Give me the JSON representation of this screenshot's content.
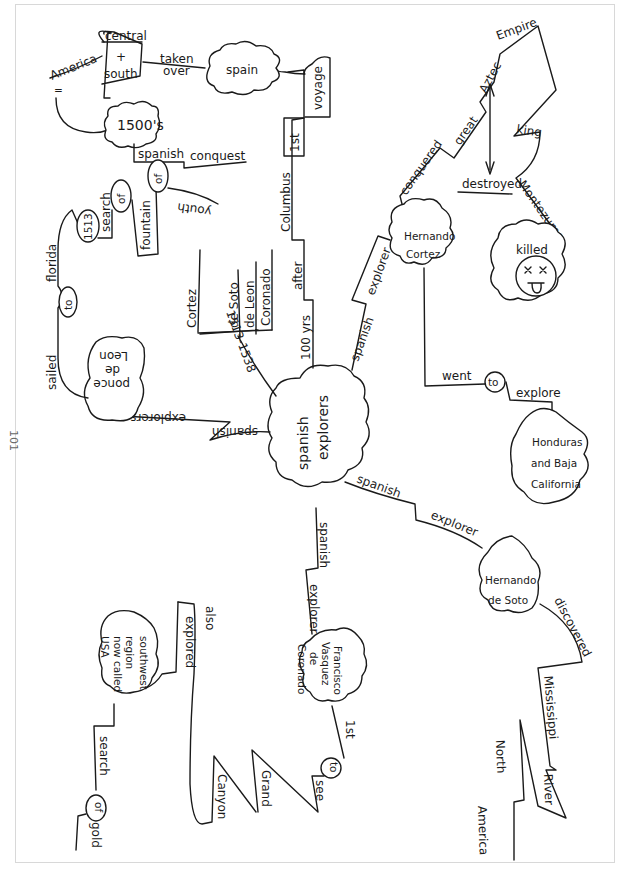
{
  "page_number": "101",
  "central_topic": {
    "line1": "spanish",
    "line2": "explorers"
  },
  "branches": {
    "history": {
      "label1": "100 yrs",
      "label2": "after",
      "label3": "Columbus",
      "label4": "1st",
      "label5": "voyage",
      "node_spain": "spain",
      "link_taken": "taken",
      "link_over": "over",
      "node_america_central": "central",
      "node_america_plus": "+",
      "node_america_south": "south",
      "link_america": "America",
      "link_equals": "=",
      "node_1500s": "1500's",
      "link_spanish": "spanish",
      "link_conquest": "conquest"
    },
    "timeline": {
      "range": "1513-1538",
      "names": [
        "Cortez",
        "de Soto",
        "de Leon",
        "Coronado"
      ]
    },
    "ponce": {
      "link1": "spanish",
      "link2": "explorers",
      "node_line1": "ponce",
      "node_line2": "de",
      "node_line3": "Leon",
      "sailed": "sailed",
      "to": "to",
      "florida": "florida",
      "year": "1513",
      "search": "search",
      "of1": "of",
      "fountain": "fountain",
      "of2": "of",
      "youth": "youth"
    },
    "cortez": {
      "link1": "spanish",
      "link2": "explorer",
      "node_line1": "Hernando",
      "node_line2": "Cortez",
      "conquered": "conquered",
      "great": "great",
      "aztec": "Aztec",
      "empire": "Empire",
      "destroyed": "destroyed",
      "king": "king",
      "montezuma": "Montezuma",
      "killed": "killed",
      "went": "went",
      "to": "to",
      "explore": "explore",
      "dest_line1": "Honduras",
      "dest_line2": "and Baja",
      "dest_line3": "California"
    },
    "desoto": {
      "link1": "spanish",
      "link2": "explorer",
      "node_line1": "Hernando",
      "node_line2": "de Soto",
      "discovered": "discovered",
      "mississippi": "Mississippi",
      "river": "River",
      "north": "North",
      "america": "America"
    },
    "coronado": {
      "link1": "spanish",
      "link2": "explorer",
      "node_line1": "Francisco",
      "node_line2": "Vasquez",
      "node_line3": "de",
      "node_line4": "Coronado",
      "first": "1st",
      "to": "to",
      "see": "see",
      "grand": "Grand",
      "canyon": "Canyon",
      "also": "also",
      "explored": "explored",
      "region_line1": "southwest",
      "region_line2": "region",
      "region_line3": "now called",
      "region_line4": "USA",
      "search": "search",
      "of": "of",
      "gold": "gold"
    }
  }
}
